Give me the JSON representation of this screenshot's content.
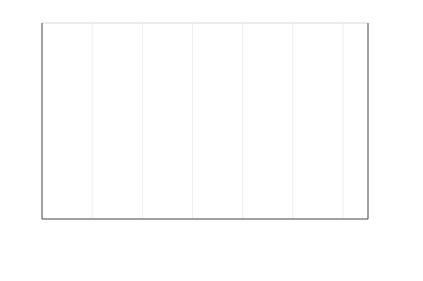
{
  "chart_data": {
    "type": "line",
    "title": "",
    "subtitle": "",
    "xlabel": "",
    "ylabel": "",
    "ylabel_right": "",
    "xlim": [
      2004.0,
      2010.5
    ],
    "ylim": [
      -200,
      150
    ],
    "ylim_right": [
      -200,
      150
    ],
    "grid": "faint vertical gridlines at year ticks",
    "legend_position": "below-axis",
    "axes": {
      "y_left_ticks": [
        "150",
        "100",
        "50",
        "0",
        "-50",
        "-100",
        "-150",
        "-200"
      ],
      "y_left_values": [
        150,
        100,
        50,
        0,
        -50,
        -100,
        -150,
        -200
      ],
      "y_right_ticks": [
        "150",
        "100",
        "50",
        "0",
        "-50",
        "-100",
        "-150",
        "-200"
      ],
      "y_right_values": [
        150,
        100,
        50,
        0,
        -50,
        -100,
        -150,
        -200
      ],
      "x_ticks": [
        "2004",
        "2005",
        "2006",
        "2007",
        "2008",
        "2009",
        "2010"
      ],
      "x_values": [
        2004,
        2005,
        2006,
        2007,
        2008,
        2009,
        2010
      ]
    },
    "colors": {
      "2_year_nominal": "#c8c8c8",
      "3_year_nominal": "#6e6e6e",
      "5_year_nominal": "#2b2b2b",
      "2_year_real": "#9a9a9a",
      "3_year_real": "#b4b4b4",
      "5_year_real": "#111111",
      "axis": "#444444",
      "gridline": "#ededed",
      "background": "#ffffff",
      "text": "#1a1a1a"
    },
    "x": [
      2004.0,
      2004.08,
      2004.17,
      2004.25,
      2004.33,
      2004.42,
      2004.5,
      2004.58,
      2004.67,
      2004.75,
      2004.83,
      2004.92,
      2005.0,
      2005.08,
      2005.17,
      2005.25,
      2005.33,
      2005.42,
      2005.5,
      2005.58,
      2005.67,
      2005.75,
      2005.83,
      2005.92,
      2006.0,
      2006.08,
      2006.17,
      2006.25,
      2006.33,
      2006.42,
      2006.5,
      2006.58,
      2006.67,
      2006.75,
      2006.83,
      2006.92,
      2007.0,
      2007.08,
      2007.17,
      2007.25,
      2007.33,
      2007.42,
      2007.5,
      2007.58,
      2007.67,
      2007.75,
      2007.83,
      2007.92,
      2008.0,
      2008.08,
      2008.17,
      2008.25,
      2008.33,
      2008.42,
      2008.5,
      2008.58,
      2008.67,
      2008.75,
      2008.83,
      2008.92,
      2009.0,
      2009.08,
      2009.17,
      2009.25,
      2009.33,
      2009.42,
      2009.5,
      2009.58,
      2009.67,
      2009.75,
      2009.83,
      2009.92,
      2010.0,
      2010.08,
      2010.17,
      2010.25,
      2010.33,
      2010.42,
      2010.5
    ],
    "series": [
      {
        "name": "2 year nominal",
        "color": "#c8c8c8",
        "width": 1.0,
        "values": [
          0,
          -3,
          5,
          -2,
          8,
          4,
          -6,
          2,
          10,
          3,
          -4,
          6,
          2,
          -5,
          7,
          12,
          5,
          -2,
          6,
          9,
          3,
          -3,
          5,
          8,
          4,
          -2,
          7,
          3,
          -5,
          2,
          8,
          5,
          -3,
          6,
          9,
          4,
          -2,
          5,
          8,
          3,
          -4,
          6,
          10,
          5,
          -2,
          7,
          4,
          -3,
          6,
          12,
          4,
          -8,
          5,
          14,
          22,
          10,
          -12,
          30,
          55,
          72,
          58,
          40,
          24,
          10,
          -5,
          -18,
          -30,
          -20,
          -8,
          6,
          18,
          10,
          -2,
          -10,
          -18,
          -8,
          2,
          -6,
          -14
        ]
      },
      {
        "name": "3 year nominal",
        "color": "#6e6e6e",
        "width": 1.2,
        "values": [
          3,
          8,
          -4,
          12,
          20,
          6,
          -8,
          4,
          14,
          8,
          -2,
          10,
          5,
          -6,
          14,
          18,
          8,
          -4,
          10,
          14,
          5,
          -6,
          9,
          12,
          7,
          -3,
          11,
          6,
          -7,
          5,
          12,
          8,
          -4,
          9,
          13,
          7,
          -3,
          8,
          12,
          5,
          -6,
          9,
          15,
          8,
          -3,
          11,
          6,
          -5,
          9,
          18,
          6,
          -12,
          8,
          20,
          32,
          14,
          -18,
          42,
          80,
          100,
          78,
          52,
          30,
          12,
          -8,
          -26,
          -42,
          -28,
          -10,
          10,
          26,
          14,
          -4,
          -14,
          -26,
          -12,
          4,
          -8,
          -20
        ]
      },
      {
        "name": "5 year nominal",
        "color": "#2b2b2b",
        "width": 1.2,
        "values": [
          -2,
          6,
          -8,
          10,
          16,
          2,
          -10,
          -2,
          8,
          4,
          -6,
          6,
          3,
          -10,
          10,
          14,
          4,
          -8,
          6,
          10,
          2,
          -9,
          5,
          9,
          4,
          -6,
          8,
          3,
          -10,
          2,
          9,
          5,
          -7,
          6,
          10,
          4,
          -6,
          5,
          9,
          2,
          -9,
          6,
          11,
          5,
          -6,
          8,
          3,
          -8,
          5,
          14,
          2,
          -16,
          4,
          16,
          28,
          8,
          -24,
          50,
          95,
          120,
          92,
          60,
          34,
          14,
          -10,
          -32,
          -50,
          -34,
          -12,
          12,
          32,
          16,
          -6,
          -18,
          -32,
          -14,
          5,
          -10,
          -24
        ]
      },
      {
        "name": "2 year real",
        "color": "#9a9a9a",
        "width": 1.0,
        "values": [
          -5,
          -10,
          2,
          -8,
          4,
          -2,
          -12,
          -4,
          6,
          -2,
          -9,
          2,
          -3,
          -12,
          4,
          8,
          0,
          -8,
          2,
          6,
          -2,
          -10,
          1,
          5,
          0,
          -8,
          4,
          -1,
          -11,
          -2,
          5,
          1,
          -9,
          2,
          6,
          0,
          -8,
          1,
          5,
          -2,
          -11,
          2,
          7,
          1,
          -9,
          4,
          0,
          -10,
          2,
          8,
          -4,
          -22,
          -8,
          -30,
          -48,
          -70,
          -95,
          -60,
          -30,
          -15,
          -28,
          -45,
          -30,
          -12,
          8,
          26,
          44,
          28,
          10,
          -8,
          -26,
          -12,
          4,
          14,
          26,
          12,
          -4,
          8,
          18
        ]
      },
      {
        "name": "3 year  real",
        "color": "#b4b4b4",
        "width": 1.0,
        "values": [
          -8,
          -14,
          0,
          -12,
          2,
          -5,
          -16,
          -8,
          3,
          -6,
          -12,
          0,
          -6,
          -16,
          1,
          5,
          -3,
          -12,
          0,
          3,
          -5,
          -14,
          -2,
          2,
          -3,
          -12,
          1,
          -4,
          -15,
          -5,
          2,
          -2,
          -12,
          0,
          3,
          -3,
          -12,
          -2,
          2,
          -5,
          -15,
          0,
          4,
          -2,
          -12,
          1,
          -3,
          -14,
          0,
          5,
          -8,
          -30,
          -14,
          -42,
          -66,
          -95,
          -130,
          -85,
          -45,
          -22,
          -40,
          -62,
          -42,
          -18,
          10,
          34,
          58,
          38,
          14,
          -10,
          -34,
          -16,
          6,
          18,
          34,
          16,
          -5,
          10,
          24
        ]
      },
      {
        "name": "5 year real",
        "color": "#111111",
        "width": 1.4,
        "values": [
          -4,
          -8,
          1,
          -6,
          5,
          0,
          -9,
          -2,
          7,
          0,
          -7,
          3,
          -2,
          -9,
          5,
          9,
          1,
          -6,
          3,
          7,
          0,
          -8,
          2,
          6,
          1,
          -6,
          5,
          0,
          -9,
          0,
          6,
          2,
          -7,
          3,
          7,
          1,
          -6,
          2,
          6,
          -1,
          -9,
          3,
          8,
          2,
          -7,
          5,
          1,
          -8,
          3,
          9,
          -2,
          -18,
          -6,
          -24,
          -40,
          -58,
          -78,
          -50,
          -22,
          -8,
          -18,
          -30,
          -18,
          -5,
          6,
          14,
          20,
          14,
          8,
          2,
          -6,
          0,
          6,
          10,
          14,
          8,
          2,
          6,
          10
        ]
      }
    ]
  },
  "legend": {
    "rows": [
      [
        {
          "label": "2 year nominal",
          "color": "#c8c8c8",
          "width": 1.0
        },
        {
          "label": "3 year nominal",
          "color": "#6e6e6e",
          "width": 1.2
        },
        {
          "label": "5 year nominal",
          "color": "#2b2b2b",
          "width": 1.2
        }
      ],
      [
        {
          "label": "2 year real",
          "color": "#9a9a9a",
          "width": 1.0
        },
        {
          "label": "3 year  real",
          "color": "#b4b4b4",
          "width": 1.0
        },
        {
          "label": "5 year real",
          "color": "#111111",
          "width": 1.4
        }
      ]
    ]
  }
}
